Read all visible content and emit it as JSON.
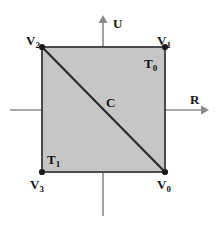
{
  "figure": {
    "background_color": "#ffffff",
    "fill_color": "#c6c6c6",
    "stroke_color": "#3a3a3a",
    "axis_color": "#8a8a8a",
    "label_color": "#141414"
  },
  "axes": {
    "horizontal": {
      "name": "R",
      "label": "R",
      "arrow": "arrow-right",
      "x_start": 10,
      "x_end": 207,
      "y": 110
    },
    "vertical": {
      "name": "U",
      "label": "U",
      "arrow": "arrow-up",
      "y_start": 16,
      "y_end": 216,
      "x": 103
    },
    "origin": {
      "label": "C",
      "x": 103,
      "y": 110
    }
  },
  "square": {
    "left": 42,
    "top": 47,
    "right": 165,
    "bottom": 172,
    "width": 123,
    "height": 125
  },
  "vertices": [
    {
      "id": "V0",
      "main": "V",
      "sub": "0",
      "x": 165,
      "y": 172,
      "label_x": 157,
      "label_y": 176,
      "position": "bottom-right"
    },
    {
      "id": "V1",
      "main": "V",
      "sub": "1",
      "x": 165,
      "y": 47,
      "label_x": 157,
      "label_y": 32,
      "position": "top-right"
    },
    {
      "id": "V2",
      "main": "V",
      "sub": "2",
      "x": 42,
      "y": 47,
      "label_x": 26,
      "label_y": 32,
      "position": "top-left"
    },
    {
      "id": "V3",
      "main": "V",
      "sub": "3",
      "x": 42,
      "y": 172,
      "label_x": 30,
      "label_y": 176,
      "position": "bottom-left"
    }
  ],
  "triangles": [
    {
      "id": "T0",
      "main": "T",
      "sub": "0",
      "label_x": 144,
      "label_y": 55,
      "region": "upper-right"
    },
    {
      "id": "T1",
      "main": "T",
      "sub": "1",
      "label_x": 47,
      "label_y": 151,
      "region": "lower-left"
    }
  ],
  "diagonal": {
    "from": "V2",
    "to": "V0",
    "x1": 42,
    "y1": 47,
    "x2": 165,
    "y2": 172
  },
  "center_point": {
    "label": "C",
    "label_x": 106,
    "label_y": 96
  }
}
